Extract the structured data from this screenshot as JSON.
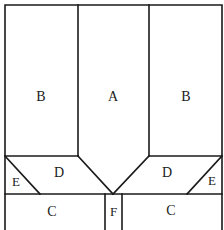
{
  "diagram": {
    "panels": [
      {
        "id": "A",
        "label": "A",
        "x": 113,
        "y": 98
      },
      {
        "id": "B-left",
        "label": "B",
        "x": 41,
        "y": 98
      },
      {
        "id": "B-right",
        "label": "B",
        "x": 186,
        "y": 98
      },
      {
        "id": "D-left",
        "label": "D",
        "x": 59,
        "y": 175
      },
      {
        "id": "D-right",
        "label": "D",
        "x": 167,
        "y": 175
      },
      {
        "id": "E-left",
        "label": "E",
        "x": 16,
        "y": 183
      },
      {
        "id": "E-right",
        "label": "E",
        "x": 211,
        "y": 183
      },
      {
        "id": "C-left",
        "label": "C",
        "x": 52,
        "y": 213
      },
      {
        "id": "C-right",
        "label": "C",
        "x": 171,
        "y": 213
      },
      {
        "id": "F",
        "label": "F",
        "x": 113,
        "y": 213
      }
    ]
  },
  "labels": {
    "A": "A",
    "B": "B",
    "C": "C",
    "D": "D",
    "E": "E",
    "F": "F"
  }
}
